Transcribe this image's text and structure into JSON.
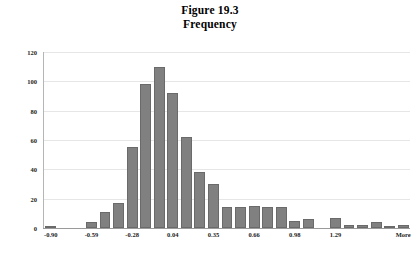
{
  "figure": {
    "title_line1": "Figure 19.3",
    "title_line2": "Frequency"
  },
  "colors": {
    "bar_fill": "#808080",
    "bar_border": "#6a6a6a",
    "gridline": "#e6e6e6",
    "axis": "#9a9a9a",
    "text": "#222222",
    "background": "#ffffff"
  },
  "chart_data": {
    "type": "bar",
    "title": "Figure 19.3 Frequency",
    "xlabel": "",
    "ylabel": "",
    "ylim": [
      0,
      120
    ],
    "yticks": [
      0,
      20,
      40,
      60,
      80,
      100,
      120
    ],
    "ytick_labels": [
      "0",
      "20",
      "40",
      "60",
      "80",
      "100",
      "120"
    ],
    "grid": true,
    "legend": "none",
    "xtick_labels": [
      "-0.90",
      "-0.59",
      "-0.28",
      "0.04",
      "0.35",
      "0.66",
      "0.98",
      "1.29",
      "More"
    ],
    "xtick_bin_indexes": [
      0,
      3,
      6,
      9,
      12,
      15,
      18,
      21,
      26
    ],
    "categories": [
      "-0.90",
      "-0.80",
      "-0.70",
      "-0.59",
      "-0.49",
      "-0.38",
      "-0.28",
      "-0.17",
      "-0.07",
      "0.04",
      "0.14",
      "0.25",
      "0.35",
      "0.46",
      "0.56",
      "0.66",
      "0.77",
      "0.87",
      "0.98",
      "1.08",
      "1.19",
      "1.29",
      "1.40",
      "1.50",
      "1.61",
      "1.71",
      "More"
    ],
    "values": [
      1,
      0,
      0,
      4,
      11,
      17,
      55,
      98,
      110,
      92,
      62,
      38,
      30,
      14,
      14,
      15,
      14,
      14,
      5,
      6,
      0,
      7,
      2,
      2,
      4,
      1,
      2
    ]
  }
}
